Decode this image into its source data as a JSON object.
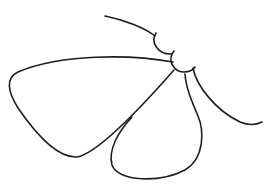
{
  "illustration": {
    "subject": "moth line drawing",
    "stroke_color": "#1e1e1e",
    "background": "#ffffff"
  }
}
